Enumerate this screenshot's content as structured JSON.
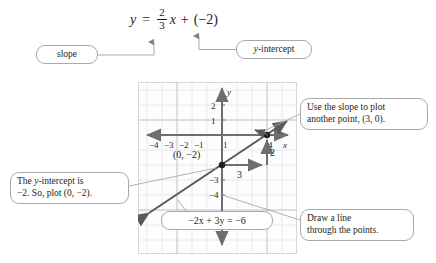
{
  "equation": {
    "lhs": "y",
    "equals": "=",
    "fraction": {
      "numerator": "2",
      "denominator": "3"
    },
    "variable": "x",
    "plus": "+",
    "constant": "(−2)"
  },
  "callouts": {
    "slope": {
      "label": "slope"
    },
    "y_intercept": {
      "label": "y-intercept"
    },
    "use_slope": {
      "line1": "Use the slope to plot",
      "line2": "another point, (3, 0)."
    },
    "y_intercept_explain": {
      "line1": "The y-intercept is",
      "line2": "−2. So, plot (0, −2)."
    },
    "draw_line": {
      "line1": "Draw a line",
      "line2": "through the points."
    },
    "standard_form": {
      "label": "−2x + 3y = −6"
    }
  },
  "chart_data": {
    "type": "line",
    "title": "",
    "xlabel": "x",
    "ylabel": "y",
    "xlim": [
      -5,
      5
    ],
    "ylim": [
      -6,
      3
    ],
    "grid": true,
    "x_ticks": [
      -4,
      -3,
      -2,
      -1,
      1
    ],
    "x_tick_labels": [
      "−4",
      "−3",
      "−2",
      "−1",
      "1"
    ],
    "x_extra_ticks": [
      4
    ],
    "x_extra_tick_labels": [
      "4"
    ],
    "y_ticks": [
      2,
      1,
      -3,
      -4
    ],
    "y_tick_labels": [
      "2",
      "1",
      "−3",
      "−4"
    ],
    "series": [
      {
        "name": "y = (2/3)x - 2",
        "slope": 0.6666667,
        "intercept": -2,
        "equation_slope_intercept": "y = (2/3)x + (−2)",
        "equation_standard": "−2x + 3y = −6",
        "x_range": [
          -5,
          5
        ]
      }
    ],
    "points": [
      {
        "x": 0,
        "y": -2,
        "label": "(0, −2)",
        "role": "y-intercept"
      },
      {
        "x": 3,
        "y": 0,
        "label": "(3, 0)",
        "role": "plotted-from-slope"
      }
    ],
    "slope_triangle": {
      "run": 3,
      "rise": 2,
      "run_label": "3",
      "rise_label": "2",
      "from": {
        "x": 0,
        "y": -2
      },
      "to": {
        "x": 3,
        "y": 0
      }
    }
  },
  "colors": {
    "line": "#58595b",
    "grid_minor": "#e8e6ea",
    "grid_major": "#c9c6cd",
    "axis": "#6d6e71",
    "text": "#231f20",
    "bubble_border": "#a7a9ac",
    "connector": "#a7a9ac"
  }
}
